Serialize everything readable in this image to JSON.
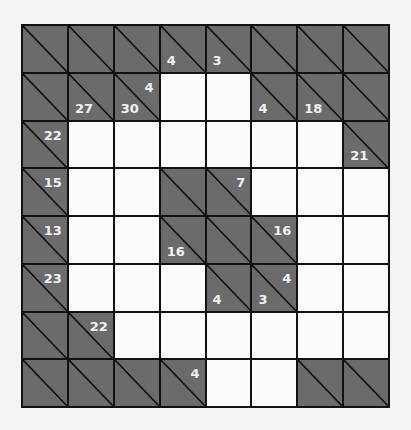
{
  "puzzle": {
    "type": "kakuro",
    "rows": 8,
    "cols": 8,
    "colors": {
      "block": "#6b6b6b",
      "white": "#fbfbfb",
      "line": "#111111",
      "clue_text": "#f2f2f2"
    },
    "grid": [
      [
        {
          "type": "block"
        },
        {
          "type": "block"
        },
        {
          "type": "block"
        },
        {
          "type": "block",
          "down": "4"
        },
        {
          "type": "block",
          "down": "3"
        },
        {
          "type": "block"
        },
        {
          "type": "block"
        },
        {
          "type": "block"
        }
      ],
      [
        {
          "type": "block"
        },
        {
          "type": "block",
          "down": "27"
        },
        {
          "type": "block",
          "down": "30",
          "across": "4"
        },
        {
          "type": "white",
          "value": ""
        },
        {
          "type": "white",
          "value": ""
        },
        {
          "type": "block",
          "down": "4"
        },
        {
          "type": "block",
          "down": "18"
        },
        {
          "type": "block"
        }
      ],
      [
        {
          "type": "block",
          "across": "22"
        },
        {
          "type": "white",
          "value": ""
        },
        {
          "type": "white",
          "value": ""
        },
        {
          "type": "white",
          "value": ""
        },
        {
          "type": "white",
          "value": ""
        },
        {
          "type": "white",
          "value": ""
        },
        {
          "type": "white",
          "value": ""
        },
        {
          "type": "block",
          "down": "21"
        }
      ],
      [
        {
          "type": "block",
          "across": "15"
        },
        {
          "type": "white",
          "value": ""
        },
        {
          "type": "white",
          "value": ""
        },
        {
          "type": "block"
        },
        {
          "type": "block",
          "across": "7"
        },
        {
          "type": "white",
          "value": ""
        },
        {
          "type": "white",
          "value": ""
        },
        {
          "type": "white",
          "value": ""
        }
      ],
      [
        {
          "type": "block",
          "across": "13"
        },
        {
          "type": "white",
          "value": ""
        },
        {
          "type": "white",
          "value": ""
        },
        {
          "type": "block",
          "down": "16"
        },
        {
          "type": "block"
        },
        {
          "type": "block",
          "across": "16"
        },
        {
          "type": "white",
          "value": ""
        },
        {
          "type": "white",
          "value": ""
        }
      ],
      [
        {
          "type": "block",
          "across": "23"
        },
        {
          "type": "white",
          "value": ""
        },
        {
          "type": "white",
          "value": ""
        },
        {
          "type": "white",
          "value": ""
        },
        {
          "type": "block",
          "down": "4"
        },
        {
          "type": "block",
          "down": "3",
          "across": "4"
        },
        {
          "type": "white",
          "value": ""
        },
        {
          "type": "white",
          "value": ""
        }
      ],
      [
        {
          "type": "block"
        },
        {
          "type": "block",
          "across": "22"
        },
        {
          "type": "white",
          "value": ""
        },
        {
          "type": "white",
          "value": ""
        },
        {
          "type": "white",
          "value": ""
        },
        {
          "type": "white",
          "value": ""
        },
        {
          "type": "white",
          "value": ""
        },
        {
          "type": "white",
          "value": ""
        }
      ],
      [
        {
          "type": "block"
        },
        {
          "type": "block"
        },
        {
          "type": "block"
        },
        {
          "type": "block",
          "across": "4"
        },
        {
          "type": "white",
          "value": ""
        },
        {
          "type": "white",
          "value": ""
        },
        {
          "type": "block"
        },
        {
          "type": "block"
        }
      ]
    ]
  }
}
